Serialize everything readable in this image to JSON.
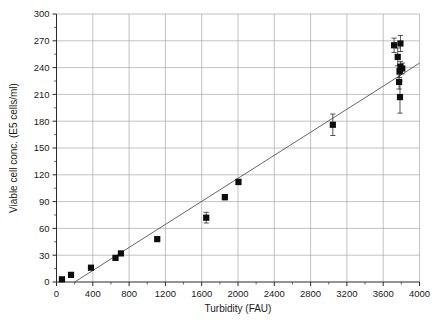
{
  "figure": {
    "title": "",
    "background_color": "#ffffff",
    "marker_color": "#0d0d0d",
    "trendline_color": "#555555",
    "grid_color": "#a8a8a8",
    "axis_color": "#2a2a2a"
  },
  "chart_data": {
    "type": "scatter",
    "title": "",
    "xlabel": "Turbidity (FAU)",
    "ylabel": "Viable cell conc. (E5 cells/ml)",
    "xlim": [
      0,
      4000
    ],
    "ylim": [
      0,
      300
    ],
    "xticks": [
      0,
      400,
      800,
      1200,
      1600,
      2000,
      2400,
      2800,
      3200,
      3600,
      4000
    ],
    "yticks": [
      0,
      30,
      60,
      90,
      120,
      150,
      180,
      210,
      240,
      270,
      300
    ],
    "xtick_labels": [
      "0",
      "400",
      "800",
      "1200",
      "1600",
      "2000",
      "2400",
      "2800",
      "3200",
      "3600",
      "4000"
    ],
    "ytick_labels": [
      "0",
      "30",
      "60",
      "90",
      "120",
      "150",
      "180",
      "210",
      "240",
      "270",
      "300"
    ],
    "grid": "horizontal-and-vertical",
    "legend": "none",
    "xtick_minor_interval": 200,
    "ytick_minor_interval": 15,
    "series": [
      {
        "name": "Viable cell concentration vs turbidity",
        "marker": "filled-square",
        "points": [
          {
            "x": 60,
            "y": 3,
            "yerr": 2
          },
          {
            "x": 160,
            "y": 8,
            "yerr": 2
          },
          {
            "x": 380,
            "y": 16,
            "yerr": 2
          },
          {
            "x": 650,
            "y": 27,
            "yerr": 2
          },
          {
            "x": 710,
            "y": 32,
            "yerr": 2
          },
          {
            "x": 1110,
            "y": 48,
            "yerr": 2
          },
          {
            "x": 1650,
            "y": 72,
            "yerr": 6
          },
          {
            "x": 1855,
            "y": 95,
            "yerr": 3
          },
          {
            "x": 2005,
            "y": 112,
            "yerr": 3
          },
          {
            "x": 3045,
            "y": 176,
            "yerr": 12
          },
          {
            "x": 3720,
            "y": 265,
            "yerr": 8
          },
          {
            "x": 3790,
            "y": 267,
            "yerr": 9
          },
          {
            "x": 3760,
            "y": 252,
            "yerr": 10
          },
          {
            "x": 3790,
            "y": 241,
            "yerr": 6
          },
          {
            "x": 3810,
            "y": 239,
            "yerr": 6
          },
          {
            "x": 3780,
            "y": 236,
            "yerr": 7
          },
          {
            "x": 3775,
            "y": 224,
            "yerr": 8
          },
          {
            "x": 3785,
            "y": 207,
            "yerr": 18
          }
        ]
      }
    ],
    "trendline": {
      "type": "linear-fit",
      "x_start": 200,
      "y_start": 0,
      "x_end": 4000,
      "y_end": 245
    }
  }
}
